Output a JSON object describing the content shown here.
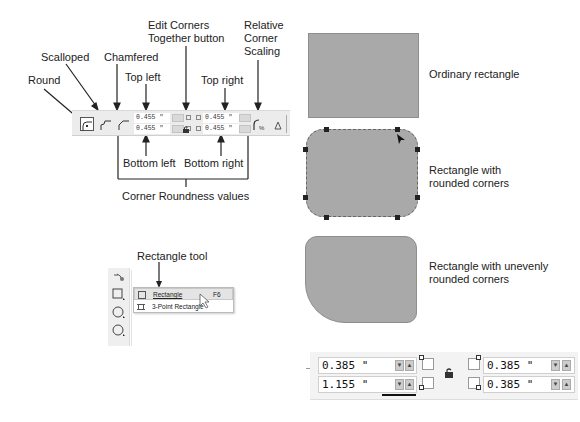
{
  "callouts": {
    "round": "Round",
    "scalloped": "Scalloped",
    "chamfered": "Chamfered",
    "top_left": "Top left",
    "edit_corners_line1": "Edit Corners",
    "edit_corners_line2": "Together button",
    "top_right": "Top right",
    "relative_line1": "Relative",
    "relative_line2": "Corner",
    "relative_line3": "Scaling",
    "bottom_left": "Bottom left",
    "bottom_right": "Bottom right",
    "corner_roundness": "Corner Roundness values",
    "rectangle_tool": "Rectangle tool"
  },
  "top_toolbar": {
    "top_left_value": "0.455 \"",
    "bottom_left_value": "0.455 \"",
    "top_right_value": "0.455 \"",
    "bottom_right_value": "0.455 \""
  },
  "shapes": {
    "ordinary": "Ordinary rectangle",
    "rounded_line1": "Rectangle with",
    "rounded_line2": "rounded corners",
    "uneven_line1": "Rectangle with unevenly",
    "uneven_line2": "rounded corners"
  },
  "flyout": {
    "items": [
      {
        "label": "Rectangle",
        "shortcut": "F6"
      },
      {
        "label": "3-Point Rectangle",
        "shortcut": ""
      }
    ]
  },
  "bottom_toolbar": {
    "top_left_value": "0.385 \"",
    "bottom_left_value": "1.155 \"",
    "top_right_value": "0.385 \"",
    "bottom_right_value": "0.385 \""
  },
  "colors": {
    "shape_fill": "#a9a9a9",
    "toolbar_bg": "#ececec"
  }
}
